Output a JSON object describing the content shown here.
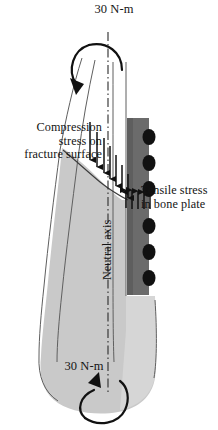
{
  "figure": {
    "title_alt": "Torsional loading of fractured bone with bone plate",
    "colors": {
      "bone_fill": "#c9c9c9",
      "bone_fill_light": "#d7d7d7",
      "bone_outline": "#6e6e6e",
      "plate_fill": "#6b6b6b",
      "plate_fill_dark": "#5f5f5f",
      "screw_notch": "#121212",
      "arrow": "#111111",
      "axis_line": "#2a2a2a",
      "text": "#141414",
      "background": "#ffffff"
    }
  },
  "labels": {
    "torque_top": "30 N-m",
    "torque_bottom": "30 N-m",
    "compression": "Compression\nstress on\nfracture surface",
    "tensile": "Tensile stress\nin bone plate",
    "neutral_axis": "Neutral axis"
  },
  "annotations": {
    "compression_arrow_count": 7,
    "compression_arrow_direction": "down",
    "tensile_arrow_count": 5,
    "tensile_arrow_direction": "up",
    "screw_hole_count": 6,
    "torque_top_rotation": "counterclockwise",
    "torque_bottom_rotation": "counterclockwise",
    "torque_value": "30 N-m"
  }
}
